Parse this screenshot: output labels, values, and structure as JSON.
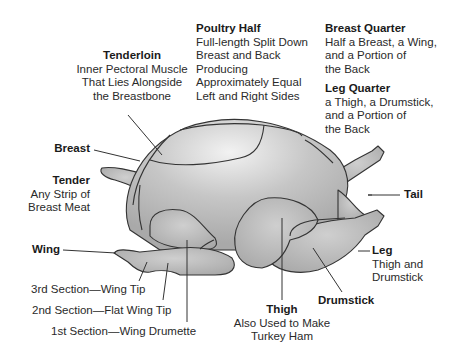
{
  "labels": {
    "tenderloin": {
      "title": "Tenderloin",
      "lines": [
        "Inner Pectoral Muscle",
        "That Lies Alongside",
        "the Breastbone"
      ]
    },
    "poultry_half": {
      "title": "Poultry Half",
      "lines": [
        "Full-length Split Down",
        "Breast and Back",
        "Producing",
        "Approximately Equal",
        "Left and Right Sides"
      ]
    },
    "breast_quarter": {
      "title": "Breast Quarter",
      "lines": [
        "Half a Breast, a Wing,",
        "and a Portion of",
        "the Back"
      ]
    },
    "leg_quarter": {
      "title": "Leg Quarter",
      "lines": [
        "a Thigh, a Drumstick,",
        "and a Portion of",
        "the Back"
      ]
    },
    "breast": {
      "title": "Breast"
    },
    "tender": {
      "title": "Tender",
      "lines": [
        "Any Strip of",
        "Breast Meat"
      ]
    },
    "tail": {
      "title": "Tail"
    },
    "wing": {
      "title": "Wing"
    },
    "wing_3rd": {
      "text": "3rd Section—Wing Tip"
    },
    "wing_2nd": {
      "text": "2nd Section—Flat Wing Tip"
    },
    "wing_1st": {
      "text": "1st Section—Wing Drumette"
    },
    "leg": {
      "title": "Leg",
      "lines": [
        "Thigh and",
        "Drumstick"
      ]
    },
    "drumstick": {
      "title": "Drumstick"
    },
    "thigh": {
      "title": "Thigh",
      "lines": [
        "Also Used to Make",
        "Turkey Ham"
      ]
    }
  },
  "colors": {
    "body_fill": "#b9b9b9",
    "highlight": "#e8e8e8",
    "outline": "#333333"
  }
}
